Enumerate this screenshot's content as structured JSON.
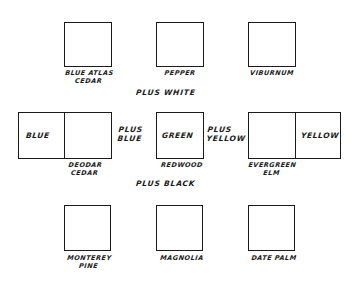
{
  "diagram": {
    "type": "color-mixing tree diagram",
    "top_row": [
      {
        "label": "BLUE ATLAS\nCEDAR"
      },
      {
        "label": "PEPPER"
      },
      {
        "label": "VIBURNUM"
      }
    ],
    "top_operator": "PLUS WHITE",
    "middle_row": [
      {
        "label": "DEODAR\nCEDAR",
        "color_cell": "BLUE",
        "operator": "PLUS\nBLUE"
      },
      {
        "label": "REDWOOD",
        "color_cell": "GREEN",
        "operator": "PLUS\nYELLOW"
      },
      {
        "label": "EVERGREEN\nELM",
        "color_cell": "YELLOW"
      }
    ],
    "bottom_operator": "PLUS BLACK",
    "bottom_row": [
      {
        "label": "MONTEREY\nPINE"
      },
      {
        "label": "MAGNOLIA"
      },
      {
        "label": "DATE PALM"
      }
    ]
  }
}
